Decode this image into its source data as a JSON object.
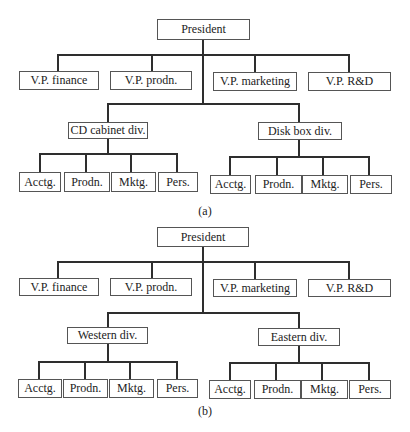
{
  "charts": [
    {
      "caption": "(a)",
      "president": "President",
      "vps": [
        "V.P. finance",
        "V.P. prodn.",
        "V.P. marketing",
        "V.P. R&D"
      ],
      "divisions": [
        {
          "label": "CD cabinet div.",
          "departments": [
            "Acctg.",
            "Prodn.",
            "Mktg.",
            "Pers."
          ]
        },
        {
          "label": "Disk box div.",
          "departments": [
            "Acctg.",
            "Prodn.",
            "Mktg.",
            "Pers."
          ]
        }
      ]
    },
    {
      "caption": "(b)",
      "president": "President",
      "vps": [
        "V.P. finance",
        "V.P. prodn.",
        "V.P. marketing",
        "V.P. R&D"
      ],
      "divisions": [
        {
          "label": "Western div.",
          "departments": [
            "Acctg.",
            "Prodn.",
            "Mktg.",
            "Pers."
          ]
        },
        {
          "label": "Eastern div.",
          "departments": [
            "Acctg.",
            "Prodn.",
            "Mktg.",
            "Pers."
          ]
        }
      ]
    }
  ]
}
